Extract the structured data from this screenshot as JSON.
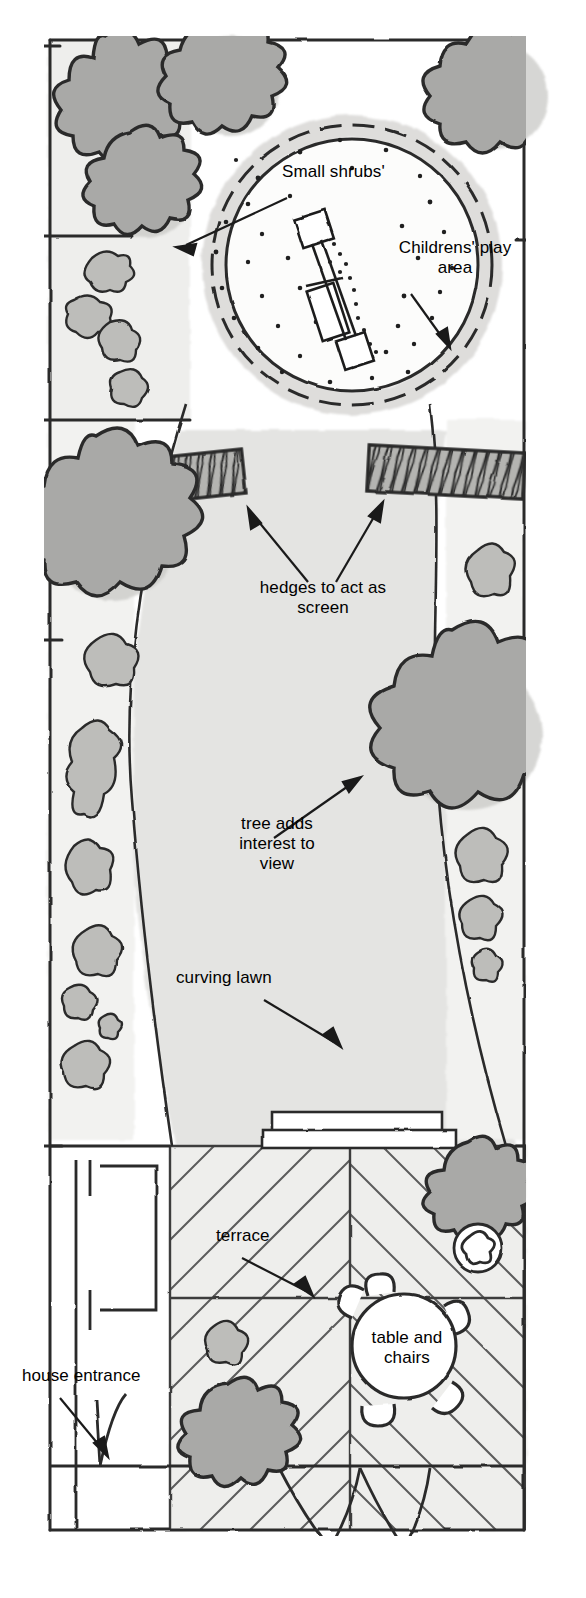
{
  "document": {
    "kind": "garden-design-plan",
    "style": "hand-drawn watercolour plan view",
    "orientation": "portrait"
  },
  "palette": {
    "ink": "#2b2b2b",
    "ink_soft": "#4a4a4a",
    "paper": "#ffffff",
    "lawn": "#e3e3e1",
    "lawn_edge": "#d8d8d6",
    "tree_canopy": "#a9a9a7",
    "tree_shadow": "#c6c6c3",
    "shrub_fill": "#b9b9b6",
    "shrub_shadow": "#d0d0cd",
    "hedge_fill": "#b4b4b1",
    "terrace_fill": "#ebebe9",
    "play_circle_fill": "#fbfbfa",
    "play_surround": "#d4d4d1"
  },
  "labels": [
    {
      "id": "small-shrubs",
      "text": "Small shrubs'",
      "x": 282,
      "y": 170,
      "width": 160,
      "align": "left",
      "size": 17,
      "leader": {
        "from": [
          285,
          196
        ],
        "to": [
          176,
          247
        ]
      }
    },
    {
      "id": "childrens-play-area",
      "text": "Childrens' play\narea",
      "x": 380,
      "y": 244,
      "width": 140,
      "align": "center",
      "size": 17,
      "leader": {
        "from": [
          413,
          292
        ],
        "to": [
          449,
          347
        ]
      }
    },
    {
      "id": "hedges-to-act-as-screen",
      "text": "hedges to act as\nscreen",
      "x": 238,
      "y": 585,
      "width": 170,
      "align": "center",
      "size": 17,
      "leader_a": {
        "from": [
          306,
          585
        ],
        "to": [
          248,
          508
        ]
      },
      "leader_b": {
        "from": [
          337,
          585
        ],
        "to": [
          383,
          502
        ]
      }
    },
    {
      "id": "tree-adds-interest-to-view",
      "text": "tree adds\ninterest to\nview",
      "x": 218,
      "y": 822,
      "width": 120,
      "align": "center",
      "size": 17,
      "leader": {
        "from": [
          272,
          840
        ],
        "to": [
          360,
          778
        ]
      }
    },
    {
      "id": "curving-lawn",
      "text": "curving lawn",
      "x": 178,
      "y": 976,
      "width": 140,
      "align": "left",
      "size": 17,
      "leader": {
        "from": [
          262,
          1002
        ],
        "to": [
          340,
          1047
        ]
      }
    },
    {
      "id": "terrace",
      "text": "terrace",
      "x": 218,
      "y": 1233,
      "width": 90,
      "align": "left",
      "size": 17,
      "leader": {
        "from": [
          240,
          1259
        ],
        "to": [
          312,
          1295
        ]
      }
    },
    {
      "id": "table-and-chairs",
      "text": "table and\nchairs",
      "x": 359,
      "y": 1337,
      "width": 110,
      "align": "center",
      "size": 17
    },
    {
      "id": "house-entrance",
      "text": "house entrance",
      "x": 24,
      "y": 1373,
      "width": 160,
      "align": "left",
      "size": 17,
      "leader": {
        "from": [
          58,
          1400
        ],
        "to": [
          108,
          1456
        ]
      }
    }
  ],
  "plan_features": {
    "boundary": "rectangular plot outline drawn freehand with double tick marks at fence posts",
    "play_area": {
      "name": "childrens-play-circle",
      "centre": [
        352,
        265
      ],
      "radius": 140,
      "inner_radius": 126,
      "surface": "bark chippings shown as scattered dots",
      "equipment": "swing frame and climbing structure drawn as linked rectangles on a diagonal"
    },
    "hedges": [
      {
        "name": "hedge-left",
        "x": 110,
        "y": 455,
        "width": 135,
        "height": 45,
        "rotation": -6
      },
      {
        "name": "hedge-right",
        "x": 368,
        "y": 448,
        "width": 155,
        "height": 48,
        "rotation": 3
      }
    ],
    "lawn": {
      "name": "curving-lawn",
      "description": "serpentine lawn sweeping from play area down to terrace"
    },
    "terrace": {
      "name": "terrace",
      "x": 170,
      "y": 1145,
      "width": 355,
      "height": 305,
      "paving": "diagonal herringbone slabs with cross joints"
    },
    "table_and_chairs": {
      "name": "table-and-chairs",
      "centre": [
        404,
        1345
      ],
      "table_radius": 50,
      "chairs": 5
    },
    "pot_plant": {
      "name": "pot-plant",
      "centre": [
        478,
        1248
      ],
      "radius": 24
    },
    "step": {
      "name": "terrace-step",
      "x": 272,
      "y": 1112,
      "width": 170,
      "height": 30
    },
    "house": {
      "name": "house-wall",
      "entrance": "door swing arcs at bottom of plan",
      "wall_y": 1530
    },
    "trees": [
      {
        "name": "tree-top-left",
        "cx": 105,
        "cy": 90,
        "r": 54
      },
      {
        "name": "tree-top-mid",
        "cx": 212,
        "cy": 72,
        "r": 52
      },
      {
        "name": "tree-top-right",
        "cx": 478,
        "cy": 82,
        "r": 56
      },
      {
        "name": "tree-upper-left",
        "cx": 130,
        "cy": 178,
        "r": 48
      },
      {
        "name": "tree-mid-left",
        "cx": 95,
        "cy": 520,
        "r": 70
      },
      {
        "name": "tree-mid-right",
        "cx": 452,
        "cy": 722,
        "r": 78
      },
      {
        "name": "tree-terrace",
        "cx": 468,
        "cy": 1180,
        "r": 42
      },
      {
        "name": "tree-bottom",
        "cx": 228,
        "cy": 1430,
        "r": 45
      }
    ],
    "border_shrubs": "irregular wiggly-outlined shrub masses along both side borders"
  }
}
